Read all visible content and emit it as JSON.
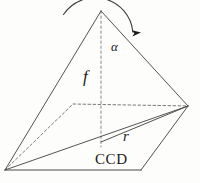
{
  "figure": {
    "kind": "geometry-diagram",
    "background_color": "#fdfdfb",
    "stroke_color": "#4a4a4a",
    "label_color": "#1a1a1a",
    "width": 200,
    "height": 183
  },
  "labels": {
    "alpha": "α",
    "focal_length": "f",
    "radius": "r",
    "sensor": "CCD"
  },
  "geometry": {
    "apex": {
      "x": 101,
      "y": 11
    },
    "base_front_left": {
      "x": 5,
      "y": 170
    },
    "base_front_right": {
      "x": 141,
      "y": 170
    },
    "base_right": {
      "x": 188,
      "y": 106
    },
    "base_back_left": {
      "x": 73,
      "y": 104
    },
    "axis_foot": {
      "x": 101,
      "y": 142
    },
    "axis_line": {
      "from": {
        "x": 101,
        "y": 11
      },
      "to": {
        "x": 101,
        "y": 147
      },
      "style": "dashed"
    },
    "radius_line": {
      "from": {
        "x": 101,
        "y": 142
      },
      "to": {
        "x": 188,
        "y": 106
      },
      "style": "solid"
    },
    "angle_arc": {
      "center": {
        "x": 101,
        "y": 11
      },
      "radius": 38,
      "start_deg": 90,
      "end_deg": 33,
      "arrow": "up-right"
    },
    "hidden_edges": [
      {
        "from": {
          "x": 5,
          "y": 170
        },
        "to": {
          "x": 73,
          "y": 104
        },
        "style": "dashed"
      },
      {
        "from": {
          "x": 73,
          "y": 104
        },
        "to": {
          "x": 188,
          "y": 106
        },
        "style": "dashed"
      }
    ],
    "solid_edges": [
      {
        "from": {
          "x": 101,
          "y": 11
        },
        "to": {
          "x": 5,
          "y": 170
        }
      },
      {
        "from": {
          "x": 101,
          "y": 11
        },
        "to": {
          "x": 188,
          "y": 106
        }
      },
      {
        "from": {
          "x": 5,
          "y": 170
        },
        "to": {
          "x": 188,
          "y": 106
        }
      },
      {
        "from": {
          "x": 5,
          "y": 170
        },
        "to": {
          "x": 141,
          "y": 170
        }
      },
      {
        "from": {
          "x": 141,
          "y": 170
        },
        "to": {
          "x": 188,
          "y": 106
        }
      }
    ]
  }
}
